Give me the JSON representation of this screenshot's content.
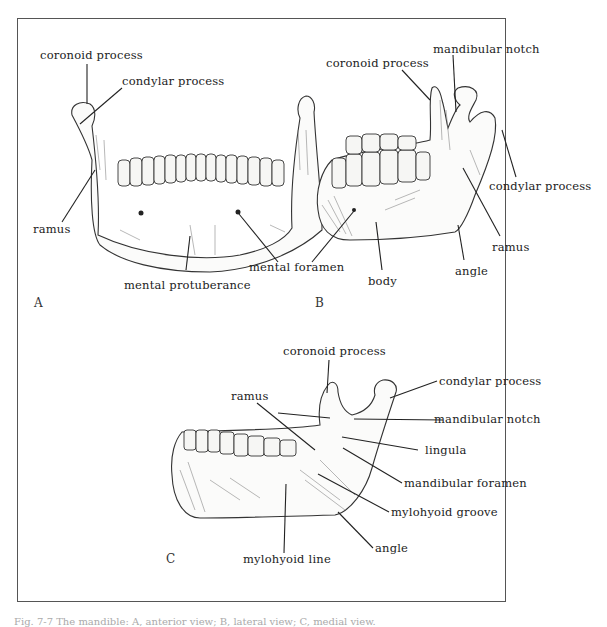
{
  "figure": {
    "panels": {
      "A": {
        "letter": "A",
        "labels": {
          "coronoid_process": "coronoid process",
          "condylar_process": "condylar process",
          "ramus": "ramus",
          "mental_foramen": "mental foramen",
          "mental_protuberance": "mental protuberance"
        }
      },
      "B": {
        "letter": "B",
        "labels": {
          "coronoid_process": "coronoid process",
          "mandibular_notch": "mandibular notch",
          "condylar_process": "condylar process",
          "ramus": "ramus",
          "angle": "angle",
          "body": "body"
        }
      },
      "C": {
        "letter": "C",
        "labels": {
          "coronoid_process": "coronoid process",
          "condylar_process": "condylar process",
          "ramus": "ramus",
          "mandibular_notch": "mandibular notch",
          "lingula": "lingula",
          "mandibular_foramen": "mandibular foramen",
          "mylohyoid_groove": "mylohyoid groove",
          "angle": "angle",
          "mylohyoid_line": "mylohyoid line"
        }
      }
    },
    "caption": "Fig. 7-7 The mandible: A, anterior view; B, lateral view; C, medial view."
  }
}
